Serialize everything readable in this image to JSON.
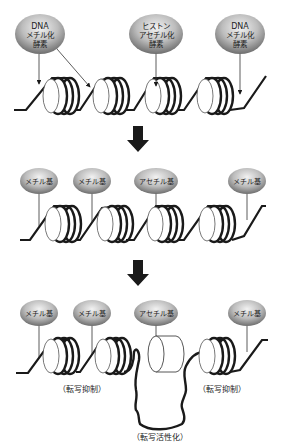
{
  "diagram": {
    "title": "",
    "colors": {
      "ellipse_fill_light": "#e8e8e8",
      "ellipse_fill_dark": "#7a7a7a",
      "dna_strand": "#1a1a1a",
      "arrow": "#1a1a1a",
      "background": "#ffffff"
    },
    "stage1": {
      "enzymes": [
        {
          "line1": "DNA",
          "line2": "メチル化",
          "line3": "酵素"
        },
        {
          "line1": "ヒストン",
          "line2": "アセチル化",
          "line3": "酵素"
        },
        {
          "line1": "DNA",
          "line2": "メチル化",
          "line3": "酵素"
        }
      ]
    },
    "stage2": {
      "marks": [
        {
          "label": "メチル基"
        },
        {
          "label": "メチル基"
        },
        {
          "label": "アセチル基"
        },
        {
          "label": "メチル基"
        }
      ]
    },
    "stage3": {
      "marks": [
        {
          "label": "メチル基"
        },
        {
          "label": "メチル基"
        },
        {
          "label": "アセチル基"
        },
        {
          "label": "メチル基"
        }
      ],
      "captions": {
        "left": "（転写抑制）",
        "right": "（転写抑制）",
        "center": "（転写活性化）"
      }
    }
  }
}
